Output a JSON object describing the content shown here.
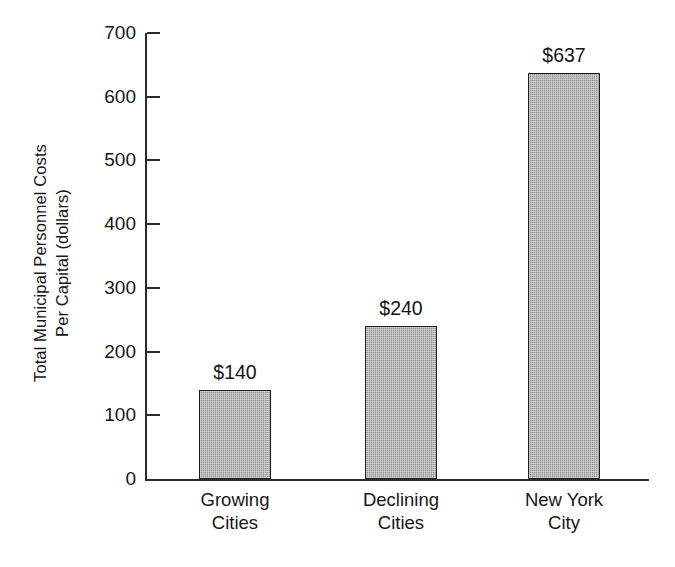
{
  "chart_data": {
    "type": "bar",
    "title": "",
    "xlabel": "",
    "ylabel_line1": "Total Municipal Personnel Costs",
    "ylabel_line2": "Per Capital (dollars)",
    "categories": [
      "Growing Cities",
      "Declining Cities",
      "New York City"
    ],
    "category_lines": [
      {
        "line1": "Growing",
        "line2": "Cities"
      },
      {
        "line1": "Declining",
        "line2": "Cities"
      },
      {
        "line1": "New York",
        "line2": "City"
      }
    ],
    "values": [
      140,
      240,
      637
    ],
    "value_labels": [
      "$140",
      "$240",
      "$637"
    ],
    "ylim": [
      0,
      700
    ],
    "ytick_values": [
      0,
      100,
      200,
      300,
      400,
      500,
      600,
      700
    ],
    "ytick_labels": [
      "0",
      "100",
      "200",
      "300",
      "400",
      "500",
      "600",
      "700"
    ],
    "grid": false,
    "legend": false,
    "bar_fill_color": "#9a9a9a",
    "bar_edge_color": "#1c1c1c",
    "axis_color": "#2b2b2b",
    "background_color": "#ffffff"
  }
}
